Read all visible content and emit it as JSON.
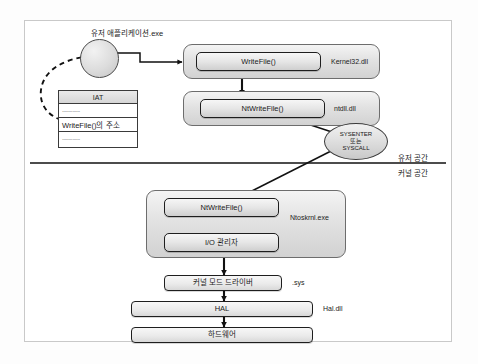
{
  "diagram": {
    "app": {
      "label": "유저 애플리케이션.exe",
      "node_name": "user-application-circle"
    },
    "iat": {
      "header": "IAT",
      "rows": [
        "..............",
        "WriteFile()의 주소",
        ".............."
      ]
    },
    "modules": [
      {
        "id": "kernel32",
        "label": "Kernel32.dll",
        "function": "WriteFile()"
      },
      {
        "id": "ntdll",
        "label": "ntdll.dll",
        "function": "NtWriteFile()"
      },
      {
        "id": "ntoskrnl",
        "label": "Ntoskrnl.exe",
        "function": "NtWriteFile()",
        "function2": "I/O 관리자"
      }
    ],
    "transition": {
      "line1": "SYSENTER",
      "line2": "또는",
      "line3": "SYSCALL"
    },
    "space": {
      "user": "유저 공간",
      "kernel": "커널 공간"
    },
    "stack": [
      {
        "id": "driver",
        "text": "커널 모드 드라이버",
        "side_label": ".sys"
      },
      {
        "id": "hal",
        "text": "HAL",
        "side_label": "Hal.dll"
      },
      {
        "id": "hardware",
        "text": "하드웨어",
        "side_label": ""
      }
    ],
    "colors": {
      "frame_border": "#c9c9c9",
      "box_border": "#1e1e1e",
      "module_fill": "#dcdcdc",
      "arrow": "#111111",
      "background": "#ffffff"
    }
  }
}
